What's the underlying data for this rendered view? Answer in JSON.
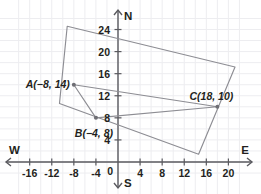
{
  "diagram": {
    "background": "#ffffff",
    "grid_color": "#ededf0",
    "axis_color": "#5a5a5f",
    "shape_color": "#8d8d93",
    "text_color": "#231f20"
  },
  "axes": {
    "x_label_left": "W",
    "x_label_right": "E",
    "y_label_top": "N",
    "y_label_bottom": "S",
    "origin_label": "0",
    "x_ticks": [
      "-16",
      "-12",
      "-8",
      "-4",
      "4",
      "8",
      "12",
      "16",
      "20"
    ],
    "x_tick_values": [
      -16,
      -12,
      -8,
      -4,
      4,
      8,
      12,
      16,
      20
    ],
    "y_ticks": [
      "4",
      "8",
      "12",
      "16",
      "20",
      "24"
    ],
    "y_tick_values": [
      4,
      8,
      12,
      16,
      20,
      24
    ],
    "x_range": [
      -18,
      22
    ],
    "y_range": [
      -2,
      26
    ],
    "grid_step": 2
  },
  "points": [
    {
      "name": "A",
      "label": "A(−8, 14)",
      "x": -8,
      "y": 14,
      "label_anchor": "end"
    },
    {
      "name": "B",
      "label": "B(−4, 8)",
      "x": -4,
      "y": 8,
      "label_anchor": "middle"
    },
    {
      "name": "C",
      "label": "C(18, 10)",
      "x": 18,
      "y": 10,
      "label_anchor": "middle"
    }
  ],
  "triangle": {
    "name": "triangle-ABC",
    "vertices": [
      "A",
      "B",
      "C"
    ]
  },
  "rectangle": {
    "name": "rotated-rectangle",
    "vertices": [
      {
        "x": -9.2,
        "y": 24.6
      },
      {
        "x": 21.2,
        "y": 17.2
      },
      {
        "x": 14.6,
        "y": 1.4
      },
      {
        "x": -10.6,
        "y": 10.6
      }
    ]
  }
}
